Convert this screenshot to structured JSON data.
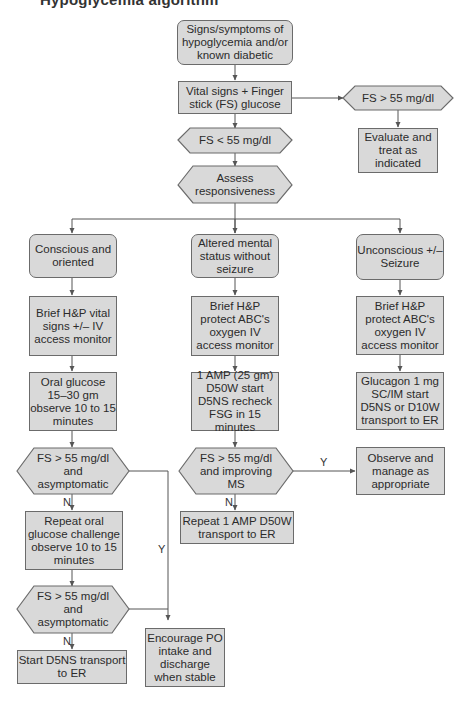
{
  "title_fragment": "Hypoglycemia algorithm",
  "colors": {
    "fill": "#d9d9d9",
    "stroke": "#6b6b6b",
    "line": "#555555"
  },
  "nodes": {
    "start": "Signs/symptoms of hypoglycemia and/or known diabetic",
    "vitals": "Vital signs + Finger stick (FS) glucose",
    "fs_high": "FS > 55 mg/dl",
    "evaluate": "Evaluate and treat as indicated",
    "fs_low": "FS < 55 mg/dl",
    "assess": "Assess responsiveness",
    "conscious": "Conscious and oriented",
    "altered": "Altered mental status without seizure",
    "unconscious": "Unconscious +/– Seizure",
    "hp_left": "Brief H&P vital signs +/– IV access monitor",
    "hp_mid": "Brief H&P protect ABC's oxygen IV access monitor",
    "hp_right": "Brief H&P protect ABC's oxygen IV access monitor",
    "oral_glucose": "Oral glucose 15–30 gm observe 10 to 15 minutes",
    "amp": "1 AMP (25 gm) D50W start D5NS recheck FSG in 15 minutes",
    "glucagon": "Glucagon 1 mg SC/IM start D5NS or D10W transport to ER",
    "dec_left1": "FS > 55 mg/dl and asymptomatic",
    "dec_mid": "FS > 55 mg/dl and improving MS",
    "observe": "Observe and manage as appropriate",
    "repeat_oral": "Repeat oral glucose challenge observe 10 to 15 minutes",
    "repeat_amp": "Repeat 1 AMP D50W transport to ER",
    "dec_left2": "FS > 55 mg/dl and asymptomatic",
    "start_d5ns": "Start D5NS transport to ER",
    "encourage": "Encourage PO intake and discharge when stable"
  },
  "edge_labels": {
    "yes": "Y",
    "no": "N"
  }
}
